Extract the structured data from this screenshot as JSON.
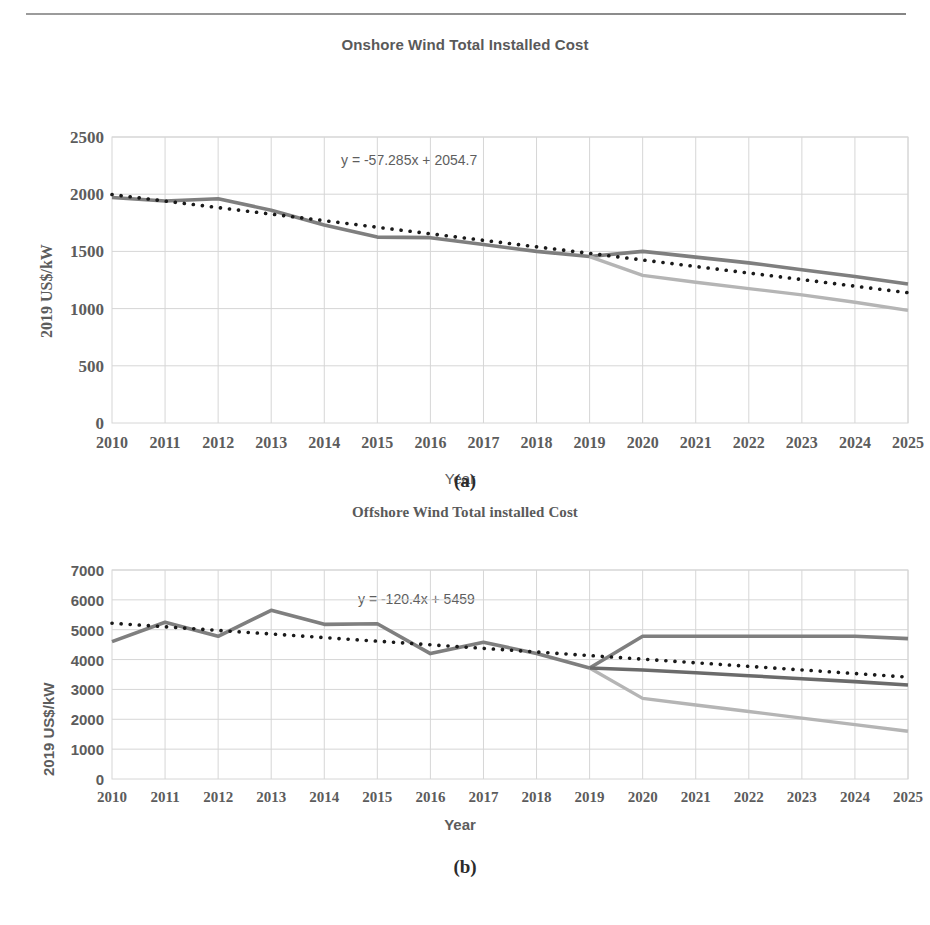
{
  "page": {
    "header_left_faint": "",
    "header_right_faint": ""
  },
  "figures": [
    {
      "caption": "(a)",
      "chart_data": {
        "type": "line",
        "title": "Onshore Wind Total Installed Cost",
        "xlabel": "Year",
        "ylabel": "2019 US$/kW",
        "annotation": "y = -57.285x + 2054.7",
        "grid": true,
        "legend": "none",
        "xlim": [
          2010,
          2025
        ],
        "ylim": [
          0,
          2500
        ],
        "yticks": [
          0,
          500,
          1000,
          1500,
          2000,
          2500
        ],
        "categories": [
          2010,
          2011,
          2012,
          2013,
          2014,
          2015,
          2016,
          2017,
          2018,
          2019,
          2020,
          2021,
          2022,
          2023,
          2024,
          2025
        ],
        "series": [
          {
            "name": "historical-and-high-scenario",
            "style": "solid-dark-gray",
            "color": "#7f7f7f",
            "values": [
              1971,
              1940,
              1960,
              1860,
              1730,
              1625,
              1620,
              1560,
              1500,
              1455,
              1500,
              1450,
              1400,
              1340,
              1280,
              1215
            ]
          },
          {
            "name": "low-scenario",
            "style": "solid-light-gray",
            "color": "#b5b5b5",
            "values": [
              null,
              null,
              null,
              null,
              null,
              null,
              null,
              null,
              null,
              1455,
              1290,
              1230,
              1175,
              1120,
              1055,
              985
            ]
          },
          {
            "name": "linear-trend",
            "style": "dotted-black",
            "color": "#1a1a1a",
            "values": [
              1997,
              1940,
              1883,
              1826,
              1769,
              1711,
              1654,
              1597,
              1540,
              1483,
              1425,
              1368,
              1311,
              1254,
              1196,
              1139
            ]
          }
        ]
      }
    },
    {
      "caption": "(b)",
      "chart_data": {
        "type": "line",
        "title": "Offshore Wind Total installed Cost",
        "xlabel": "Year",
        "ylabel": "2019 US$/kW",
        "annotation": "y = -120.4x + 5459",
        "grid": true,
        "legend": "none",
        "xlim": [
          2010,
          2025
        ],
        "ylim": [
          0,
          7000
        ],
        "yticks": [
          0,
          1000,
          2000,
          3000,
          4000,
          5000,
          6000,
          7000
        ],
        "categories": [
          2010,
          2011,
          2012,
          2013,
          2014,
          2015,
          2016,
          2017,
          2018,
          2019,
          2020,
          2021,
          2022,
          2023,
          2024,
          2025
        ],
        "series": [
          {
            "name": "historical-and-high-scenario",
            "style": "solid-dark-gray",
            "color": "#7f7f7f",
            "values": [
              4600,
              5250,
              4780,
              5650,
              5180,
              5200,
              4200,
              4580,
              4200,
              3720,
              4780,
              4780,
              4780,
              4780,
              4780,
              4700
            ]
          },
          {
            "name": "low-scenario",
            "style": "solid-light-gray",
            "color": "#b5b5b5",
            "values": [
              null,
              null,
              null,
              null,
              null,
              null,
              null,
              null,
              null,
              3720,
              2700,
              2480,
              2260,
              2040,
              1820,
              1600
            ]
          },
          {
            "name": "mid-scenario",
            "style": "solid-dark-gray-2",
            "color": "#6b6b6b",
            "values": [
              null,
              null,
              null,
              null,
              null,
              null,
              null,
              null,
              null,
              3720,
              3650,
              3560,
              3460,
              3360,
              3260,
              3150
            ]
          },
          {
            "name": "linear-trend",
            "style": "dotted-black",
            "color": "#1a1a1a",
            "values": [
              5218,
              5098,
              4977,
              4857,
              4736,
              4616,
              4496,
              4375,
              4255,
              4134,
              4014,
              3893,
              3773,
              3653,
              3532,
              3412
            ]
          }
        ]
      }
    }
  ]
}
